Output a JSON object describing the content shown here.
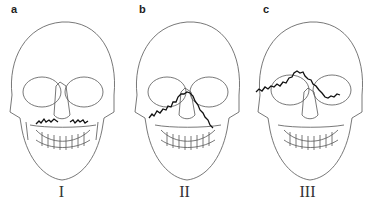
{
  "figure": {
    "panels": [
      {
        "letter": "a",
        "roman": "I",
        "fracture": "Le Fort I"
      },
      {
        "letter": "b",
        "roman": "II",
        "fracture": "Le Fort II"
      },
      {
        "letter": "c",
        "roman": "III",
        "fracture": "Le Fort III"
      }
    ],
    "colors": {
      "line": "#444444",
      "fracture": "#111111",
      "background": "#ffffff"
    }
  }
}
